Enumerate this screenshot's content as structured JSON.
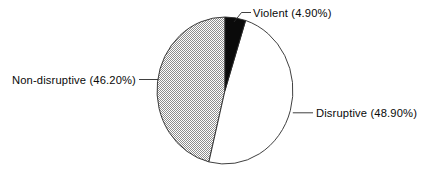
{
  "chart_data": {
    "type": "pie",
    "title": "",
    "subtitle": "",
    "xlabel": "",
    "ylabel": "",
    "legend_position": "none",
    "grid": false,
    "start_angle_deg": 90,
    "direction": "clockwise",
    "categories": [
      "Violent",
      "Disruptive",
      "Non-disruptive"
    ],
    "values": [
      4.9,
      48.9,
      46.2
    ],
    "units": "%",
    "slices": [
      {
        "name": "Violent",
        "value": 4.9,
        "label": "Violent (4.90%)",
        "fill": "black",
        "color": "#0a0a0a"
      },
      {
        "name": "Disruptive",
        "value": 48.9,
        "label": "Disruptive (48.90%)",
        "fill": "white",
        "color": "#ffffff"
      },
      {
        "name": "Non-disruptive",
        "value": 46.2,
        "label": "Non-disruptive (46.20%)",
        "fill": "hatched",
        "color": "#9a9a9a"
      }
    ],
    "annotations": [
      {
        "text": "Violent (4.90%)",
        "target": "Violent"
      },
      {
        "text": "Disruptive (48.90%)",
        "target": "Disruptive"
      },
      {
        "text": "Non-disruptive (46.20%)",
        "target": "Non-disruptive"
      }
    ],
    "colors": {
      "outline": "#2a2a2a",
      "text": "#0a0a0a",
      "background": "#ffffff",
      "hatch": "#9a9a9a"
    }
  }
}
